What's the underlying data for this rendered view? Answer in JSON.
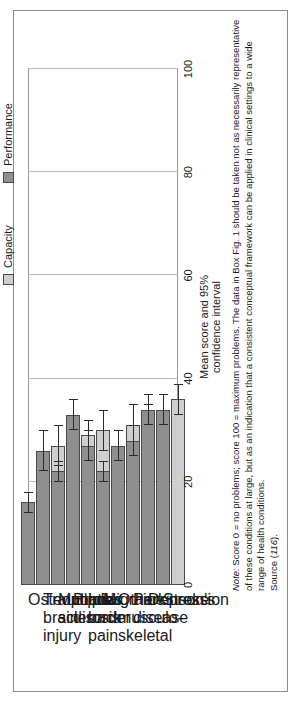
{
  "figure": {
    "legend": [
      {
        "key": "capacity",
        "label": "Capacity",
        "color": "#cfcfcf"
      },
      {
        "key": "performance",
        "label": "Performance",
        "color": "#8f8f8f"
      }
    ],
    "axis": {
      "y_title_line1": "Mean score and 95%",
      "y_title_line2": "confidence interval",
      "ticks": [
        "0",
        "20",
        "40",
        "60",
        "80",
        "100"
      ]
    },
    "note": {
      "prefix": "Note:",
      "line1": " Score 0 = no problems; score 100 = maximum problems. The data in Box Fig. 1 should be taken not as necessarily representative",
      "line2": "of these conditions at large, but as an indication that a consistent conceptual framework can be applied in clinical settings to a wide",
      "line3": "range of health conditions.",
      "line4_prefix": "Source (",
      "line4_ref": "116",
      "line4_suffix": ")."
    }
  },
  "chart_data": {
    "type": "bar",
    "title": "",
    "xlabel": "",
    "ylabel": "Mean score and 95% confidence interval",
    "ylim": [
      0,
      100
    ],
    "yticks": [
      0,
      20,
      40,
      60,
      80,
      100
    ],
    "grid": true,
    "orientation": "vertical-bars-rotated",
    "legend_position": "top",
    "categories": [
      "Osteoporosis",
      "Traumatic brain injury",
      "Multiple sclerosis",
      "Bipolar disorder",
      "Low back pain",
      "Migraine",
      "Other musculo-skeletal",
      "Parkinson's disease",
      "Depression",
      "Stroke"
    ],
    "category_label_lines": [
      [
        "Osteoporosis"
      ],
      [
        "Traumatic",
        "brain",
        "injury"
      ],
      [
        "Multiple",
        "sclerosis"
      ],
      [
        "Bipolar",
        "disorder"
      ],
      [
        "Low back",
        "pain"
      ],
      [
        "Migraine"
      ],
      [
        "Other",
        "musculo-",
        "skeletal"
      ],
      [
        "Parkinson's",
        "disease"
      ],
      [
        "Depression"
      ],
      [
        "Stroke"
      ]
    ],
    "series": [
      {
        "name": "Capacity",
        "color": "#cfcfcf",
        "values": [
          21,
          27,
          25,
          29,
          30,
          24,
          31,
          31,
          33,
          36
        ],
        "ci_lower": [
          17,
          23,
          21,
          26,
          26,
          21,
          27,
          27,
          29,
          33
        ],
        "ci_upper": [
          25,
          31,
          29,
          32,
          34,
          27,
          35,
          35,
          37,
          39
        ]
      },
      {
        "name": "Performance",
        "color": "#8f8f8f",
        "values": [
          16,
          26,
          22,
          33,
          27,
          22,
          27,
          28,
          34,
          34
        ],
        "ci_lower": [
          14,
          22,
          20,
          30,
          24,
          20,
          24,
          25,
          31,
          31
        ],
        "ci_upper": [
          18,
          30,
          24,
          36,
          30,
          24,
          30,
          31,
          37,
          37
        ]
      }
    ]
  }
}
